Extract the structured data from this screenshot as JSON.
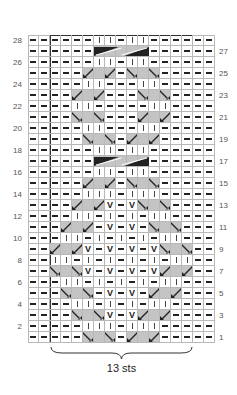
{
  "chart": {
    "columns": 17,
    "rows": 28,
    "repeat_label": "13 sts",
    "colors": {
      "gray": "#c4c4c4",
      "line": "#b8b8b8",
      "frame": "#333333",
      "ink": "#222222"
    },
    "legend_codes": {
      "p": "purl",
      "k": "knit",
      "v": "slip",
      "rs": "right-slant",
      "ls": "left-slant",
      "g": "gray-cable-fill",
      "c": "cable-5"
    },
    "row_numbers_left": [
      28,
      26,
      24,
      22,
      20,
      18,
      16,
      14,
      12,
      10,
      8,
      6,
      4,
      2
    ],
    "row_numbers_right": [
      27,
      25,
      23,
      21,
      19,
      17,
      15,
      13,
      11,
      9,
      7,
      5,
      3,
      1
    ],
    "center_rows": {
      "28": [
        "p",
        "p",
        "p",
        "p",
        "k",
        "k",
        "p",
        "k",
        "k",
        "p",
        "p",
        "p",
        "p"
      ],
      "27": [
        "p",
        "p",
        "p",
        "p",
        "c",
        "c",
        "c",
        "c",
        "c",
        "p",
        "p",
        "p",
        "p"
      ],
      "26": [
        "p",
        "p",
        "p",
        "p",
        "k",
        "k",
        "p",
        "k",
        "k",
        "p",
        "p",
        "p",
        "p"
      ],
      "25": [
        "p",
        "p",
        "p",
        "rs",
        "g",
        "rs",
        "p",
        "ls",
        "g",
        "ls",
        "p",
        "p",
        "p"
      ],
      "24": [
        "p",
        "p",
        "p",
        "k",
        "k",
        "p",
        "p",
        "p",
        "k",
        "k",
        "p",
        "p",
        "p"
      ],
      "23": [
        "p",
        "p",
        "rs",
        "g",
        "rs",
        "p",
        "p",
        "p",
        "ls",
        "g",
        "ls",
        "p",
        "p"
      ],
      "22": [
        "p",
        "p",
        "k",
        "k",
        "p",
        "p",
        "p",
        "p",
        "p",
        "k",
        "k",
        "p",
        "p"
      ],
      "21": [
        "p",
        "p",
        "ls",
        "g",
        "ls",
        "p",
        "p",
        "p",
        "rs",
        "g",
        "rs",
        "p",
        "p"
      ],
      "20": [
        "p",
        "p",
        "p",
        "k",
        "k",
        "p",
        "p",
        "p",
        "k",
        "k",
        "p",
        "p",
        "p"
      ],
      "19": [
        "p",
        "p",
        "p",
        "ls",
        "g",
        "ls",
        "p",
        "rs",
        "g",
        "rs",
        "p",
        "p",
        "p"
      ],
      "18": [
        "p",
        "p",
        "p",
        "p",
        "k",
        "k",
        "p",
        "k",
        "k",
        "p",
        "p",
        "p",
        "p"
      ],
      "17": [
        "p",
        "p",
        "p",
        "p",
        "c",
        "c",
        "c",
        "c",
        "c",
        "p",
        "p",
        "p",
        "p"
      ],
      "16": [
        "p",
        "p",
        "p",
        "p",
        "k",
        "k",
        "p",
        "k",
        "k",
        "p",
        "p",
        "p",
        "p"
      ],
      "15": [
        "p",
        "p",
        "p",
        "rs",
        "g",
        "rs",
        "p",
        "ls",
        "g",
        "ls",
        "p",
        "p",
        "p"
      ],
      "14": [
        "p",
        "p",
        "p",
        "k",
        "k",
        "k",
        "p",
        "k",
        "k",
        "k",
        "p",
        "p",
        "p"
      ],
      "13": [
        "p",
        "p",
        "rs",
        "g",
        "rs",
        "v",
        "p",
        "v",
        "ls",
        "g",
        "ls",
        "p",
        "p"
      ],
      "12": [
        "p",
        "p",
        "k",
        "k",
        "p",
        "k",
        "p",
        "k",
        "p",
        "k",
        "k",
        "p",
        "p"
      ],
      "11": [
        "p",
        "rs",
        "g",
        "rs",
        "p",
        "v",
        "p",
        "v",
        "p",
        "ls",
        "g",
        "ls",
        "p"
      ],
      "10": [
        "p",
        "k",
        "k",
        "p",
        "k",
        "p",
        "k",
        "p",
        "k",
        "p",
        "k",
        "k",
        "p"
      ],
      "9": [
        "rs",
        "g",
        "rs",
        "v",
        "p",
        "v",
        "p",
        "v",
        "p",
        "v",
        "ls",
        "g",
        "ls"
      ],
      "8": [
        "k",
        "k",
        "p",
        "k",
        "p",
        "k",
        "p",
        "k",
        "p",
        "k",
        "p",
        "k",
        "k"
      ],
      "7": [
        "ls",
        "g",
        "ls",
        "v",
        "p",
        "v",
        "p",
        "v",
        "p",
        "v",
        "rs",
        "g",
        "rs"
      ],
      "6": [
        "p",
        "k",
        "k",
        "p",
        "k",
        "p",
        "k",
        "p",
        "k",
        "p",
        "k",
        "k",
        "p"
      ],
      "5": [
        "p",
        "ls",
        "g",
        "ls",
        "p",
        "v",
        "p",
        "v",
        "p",
        "rs",
        "g",
        "rs",
        "p"
      ],
      "4": [
        "p",
        "p",
        "k",
        "k",
        "p",
        "k",
        "p",
        "k",
        "p",
        "k",
        "k",
        "p",
        "p"
      ],
      "3": [
        "p",
        "p",
        "ls",
        "g",
        "ls",
        "v",
        "p",
        "v",
        "rs",
        "g",
        "rs",
        "p",
        "p"
      ],
      "2": [
        "p",
        "p",
        "p",
        "k",
        "k",
        "k",
        "p",
        "k",
        "k",
        "k",
        "p",
        "p",
        "p"
      ],
      "1": [
        "p",
        "p",
        "p",
        "ls",
        "g",
        "ls",
        "p",
        "rs",
        "g",
        "rs",
        "p",
        "p",
        "p"
      ]
    }
  }
}
